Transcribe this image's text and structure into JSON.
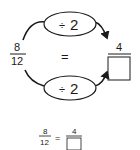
{
  "diagram": {
    "top_operation": {
      "symbol": "÷",
      "value": "2"
    },
    "bottom_operation": {
      "symbol": "÷",
      "value": "2"
    },
    "left_fraction": {
      "numerator": "8",
      "denominator": "12"
    },
    "equals": "=",
    "right_fraction": {
      "numerator": "4",
      "denominator": ""
    }
  },
  "equation": {
    "left_fraction": {
      "numerator": "8",
      "denominator": "12"
    },
    "equals": "=",
    "right_fraction": {
      "numerator": "4",
      "denominator": ""
    }
  },
  "colors": {
    "ink": "#1a1a1a",
    "background": "#ffffff"
  }
}
